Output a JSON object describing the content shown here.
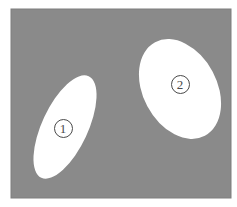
{
  "figure": {
    "canvas": {
      "width": 237,
      "height": 207,
      "background": "#ffffff"
    },
    "panel": {
      "name": "gray-field",
      "x": 11,
      "y": 9,
      "width": 220,
      "height": 189,
      "fill": "#8a8a8a",
      "stroke": "#7e7e7e"
    },
    "shapes": [
      {
        "id": "ellipse-1",
        "kind": "ellipse",
        "fill": "#ffffff",
        "cx": 65,
        "cy": 127,
        "rx": 23,
        "ry": 56,
        "rotation_deg": 25
      },
      {
        "id": "ellipse-2",
        "kind": "ellipse",
        "fill": "#ffffff",
        "cx": 180,
        "cy": 89,
        "rx": 37,
        "ry": 53,
        "rotation_deg": -28
      }
    ],
    "labels": [
      {
        "id": "label-1",
        "text": "1",
        "cx": 63,
        "cy": 128,
        "color": "#4a4a4a"
      },
      {
        "id": "label-2",
        "text": "2",
        "cx": 180,
        "cy": 84,
        "color": "#4a4a4a"
      }
    ]
  }
}
